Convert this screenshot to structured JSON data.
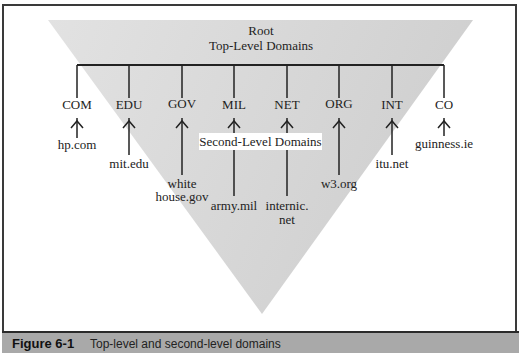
{
  "diagram": {
    "root_label": "Root",
    "tld_label": "Top-Level Domains",
    "sld_label": "Second-Level Domains",
    "colors": {
      "triangle": "#d4d4d4",
      "lines": "#222222",
      "caption_bar": "#a9a9a9"
    },
    "tlds": [
      {
        "name": "COM",
        "x": 77,
        "example": "hp.com"
      },
      {
        "name": "EDU",
        "x": 129,
        "example": "mit.edu"
      },
      {
        "name": "GOV",
        "x": 182,
        "example_line1": "white",
        "example_line2": "house.gov"
      },
      {
        "name": "MIL",
        "x": 234,
        "example": "army.mil"
      },
      {
        "name": "NET",
        "x": 287,
        "example_line1": "internic.",
        "example_line2": "net"
      },
      {
        "name": "ORG",
        "x": 339,
        "example": "w3.org"
      },
      {
        "name": "INT",
        "x": 392,
        "example": "itu.net"
      },
      {
        "name": "CO",
        "x": 444,
        "example": "guinness.ie"
      }
    ]
  },
  "caption": {
    "figure_number": "Figure 6-1",
    "text": "Top-level and second-level domains"
  }
}
